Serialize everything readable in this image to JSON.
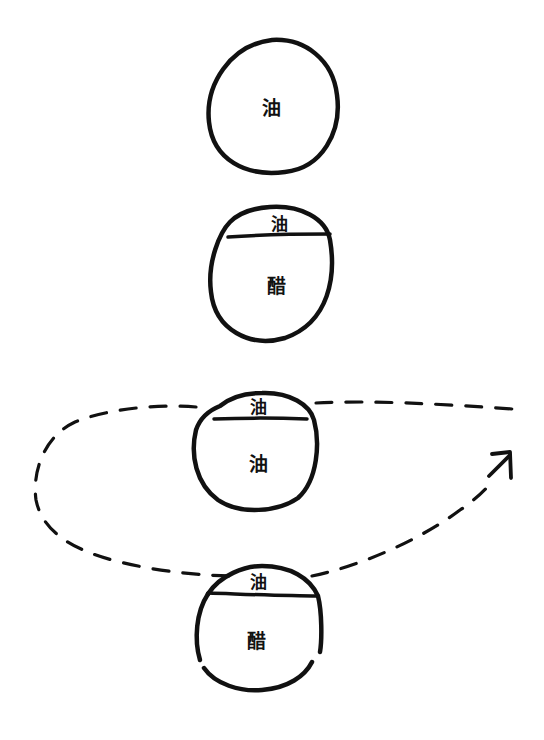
{
  "diagram": {
    "ink_color": "#111111",
    "background": "#ffffff",
    "droplets": [
      {
        "id": "droplet-1",
        "top_label": null,
        "main_label": "油"
      },
      {
        "id": "droplet-2",
        "top_label": "油",
        "main_label": "醋"
      },
      {
        "id": "droplet-3",
        "top_label": "油",
        "main_label": "油"
      },
      {
        "id": "droplet-4",
        "top_label": "油",
        "main_label": "醋"
      }
    ],
    "loop": {
      "style": "dashed",
      "arrow_direction": "up-right"
    }
  }
}
